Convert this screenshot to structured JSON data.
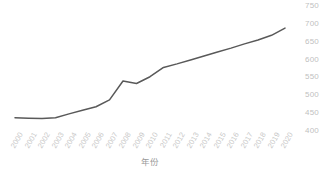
{
  "chart_data": {
    "type": "line",
    "title": "",
    "subtitle": "",
    "xlabel": "年份",
    "ylabel": "",
    "categories": [
      "2000",
      "2001",
      "2002",
      "2003",
      "2004",
      "2005",
      "2006",
      "2007",
      "2008",
      "2009",
      "2010",
      "2011",
      "2012",
      "2013",
      "2014",
      "2015",
      "2016",
      "2017",
      "2018",
      "2019",
      "2020"
    ],
    "values": [
      437,
      436,
      435,
      437,
      448,
      458,
      468,
      487,
      540,
      533,
      552,
      578,
      588,
      599,
      610,
      621,
      632,
      644,
      655,
      668,
      688
    ],
    "series": [
      {
        "name": "",
        "color": "#595959",
        "values": [
          437,
          436,
          435,
          437,
          448,
          458,
          468,
          487,
          540,
          533,
          552,
          578,
          588,
          599,
          610,
          621,
          632,
          644,
          655,
          668,
          688
        ]
      }
    ],
    "ylim": [
      400,
      750
    ],
    "ytick_step": 50,
    "yticks": [
      400,
      450,
      500,
      550,
      600,
      650,
      700,
      750
    ],
    "ytick_labels": [
      "400",
      "450",
      "500",
      "550",
      "600",
      "650",
      "700",
      "750"
    ],
    "xtick_labels": [
      "2000",
      "2001",
      "2002",
      "2003",
      "2004",
      "2005",
      "2006",
      "2007",
      "2008",
      "2009",
      "2010",
      "2011",
      "2012",
      "2013",
      "2014",
      "2015",
      "2016",
      "2017",
      "2018",
      "2019",
      "2020"
    ],
    "grid": false,
    "legend": false,
    "legend_position": "none",
    "markers": false,
    "axis_label_color": "#c9c9c9",
    "line_color": "#595959",
    "background_color": "#ffffff"
  },
  "axis": {
    "x_title": "年份"
  }
}
